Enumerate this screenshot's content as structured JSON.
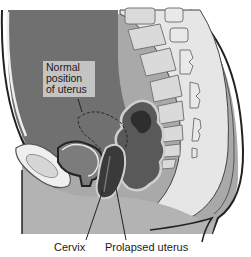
{
  "figure": {
    "callout": {
      "lines": [
        "Normal",
        "position",
        "of uterus"
      ]
    },
    "labels": {
      "cervix": "Cervix",
      "prolapsed_uterus": "Prolapsed uterus"
    },
    "colors": {
      "background": "#ffffff",
      "abdomen": "#6e6e6e",
      "skin": "#a8a8a8",
      "pelvic_floor": "#b3b3b3",
      "bone": "#dcdcdc",
      "outline": "#2a2a2a",
      "uterus": "#3a3a3a",
      "callout_bg": "#c4c4c4"
    }
  }
}
